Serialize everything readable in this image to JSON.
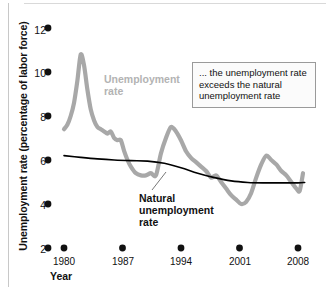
{
  "figure": {
    "name": "unemployment-rate-vs-natural-rate-chart"
  },
  "axes": {
    "y_title": "Unemployment rate (percentage of labor force)",
    "x_title": "Year",
    "y_ticks": [
      "12",
      "10",
      "8",
      "6",
      "4",
      "2"
    ],
    "x_ticks": [
      "1980",
      "1987",
      "1994",
      "2001",
      "2008"
    ]
  },
  "labels": {
    "series_gray_line1": "Unemployment",
    "series_gray_line2": "rate",
    "series_black_line1": "Natural",
    "series_black_line2": "unemployment",
    "series_black_line3": "rate"
  },
  "callout": {
    "text": "... the unemployment rate exceeds the natural unemployment rate"
  },
  "colors": {
    "unemployment_series": "#a8a8a8",
    "natural_series": "#000000",
    "text": "#111111",
    "callout_border": "#9a9a9a",
    "callout_bg": "#fbfbfb"
  },
  "chart_data": {
    "type": "line",
    "title": "",
    "xlabel": "Year",
    "ylabel": "Unemployment rate (percentage of labor force)",
    "xlim": [
      1980,
      2009
    ],
    "ylim": [
      2,
      12
    ],
    "grid": false,
    "legend": "inline-labels",
    "x_tick_values": [
      1980,
      1987,
      1994,
      2001,
      2008
    ],
    "y_tick_values": [
      2,
      4,
      6,
      8,
      10,
      12
    ],
    "annotations": [
      {
        "text": "... the unemployment rate exceeds the natural unemployment rate",
        "x": 2000,
        "y": 9.5
      },
      {
        "text": "Unemployment rate",
        "x": 1985,
        "y": 9.2
      },
      {
        "text": "Natural unemployment rate",
        "x": 1990,
        "y": 3.9
      }
    ],
    "series": [
      {
        "name": "Unemployment rate",
        "color": "#a8a8a8",
        "x": [
          1980.0,
          1980.4,
          1980.8,
          1981.2,
          1981.6,
          1982.0,
          1982.4,
          1982.8,
          1983.2,
          1983.6,
          1984.0,
          1984.4,
          1984.8,
          1985.2,
          1985.6,
          1986.0,
          1986.4,
          1986.8,
          1987.2,
          1987.6,
          1988.0,
          1988.6,
          1989.2,
          1989.8,
          1990.4,
          1991.0,
          1991.6,
          1992.2,
          1992.8,
          1993.4,
          1994.0,
          1994.6,
          1995.2,
          1995.8,
          1996.4,
          1997.0,
          1997.6,
          1998.2,
          1998.8,
          1999.4,
          2000.0,
          2000.6,
          2001.2,
          2001.8,
          2002.4,
          2003.0,
          2003.6,
          2004.2,
          2004.8,
          2005.4,
          2006.0,
          2006.6,
          2007.2,
          2007.8,
          2008.2,
          2008.6
        ],
        "y": [
          7.4,
          7.6,
          8.0,
          8.6,
          9.6,
          10.8,
          10.3,
          9.2,
          8.3,
          7.8,
          7.5,
          7.4,
          7.3,
          7.2,
          7.3,
          7.0,
          6.9,
          6.9,
          6.4,
          6.0,
          5.7,
          5.4,
          5.3,
          5.3,
          5.4,
          5.3,
          6.3,
          7.0,
          7.5,
          7.3,
          6.9,
          6.4,
          6.1,
          5.9,
          5.7,
          5.5,
          5.2,
          5.3,
          5.0,
          4.7,
          4.4,
          4.2,
          4.0,
          4.1,
          4.5,
          5.2,
          5.8,
          6.2,
          6.0,
          5.8,
          5.5,
          5.3,
          5.0,
          4.7,
          4.6,
          5.4
        ]
      },
      {
        "name": "Natural unemployment rate",
        "color": "#000000",
        "x": [
          1980,
          1982,
          1984,
          1986,
          1988,
          1990,
          1992,
          1994,
          1996,
          1998,
          2000,
          2002,
          2004,
          2006,
          2008,
          2008.8
        ],
        "y": [
          6.2,
          6.12,
          6.05,
          6.0,
          5.97,
          5.95,
          5.85,
          5.65,
          5.4,
          5.2,
          5.05,
          4.98,
          4.96,
          4.96,
          4.96,
          4.98
        ]
      }
    ]
  }
}
